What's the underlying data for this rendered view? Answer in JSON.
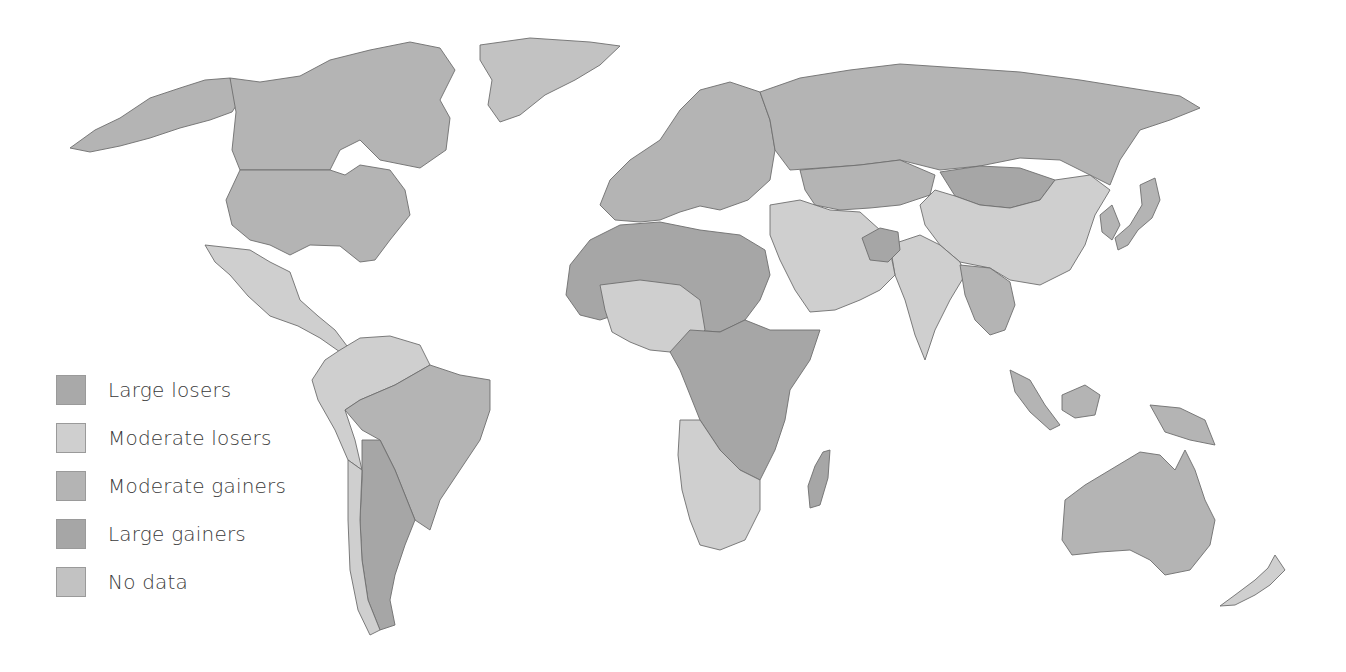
{
  "map": {
    "title": "",
    "colors": {
      "large_losers": "#a9a9a9",
      "moderate_losers": "#cfcfcf",
      "moderate_gainers": "#b4b4b4",
      "large_gainers": "#a6a6a6",
      "no_data": "#c2c2c2",
      "border": "#6e6e6e",
      "background": "#ffffff"
    },
    "regions": [
      {
        "name": "Alaska/USA",
        "class": "moderate_gainers"
      },
      {
        "name": "Canada",
        "class": "moderate_gainers"
      },
      {
        "name": "United States",
        "class": "moderate_gainers"
      },
      {
        "name": "Greenland",
        "class": "no_data"
      },
      {
        "name": "Mexico & Central America",
        "class": "moderate_losers"
      },
      {
        "name": "Colombia/Venezuela/Ecuador/Peru",
        "class": "moderate_losers"
      },
      {
        "name": "Brazil",
        "class": "moderate_gainers"
      },
      {
        "name": "Bolivia/Paraguay/Argentina",
        "class": "large_gainers"
      },
      {
        "name": "Chile",
        "class": "moderate_losers"
      },
      {
        "name": "Europe",
        "class": "moderate_gainers"
      },
      {
        "name": "Russia",
        "class": "moderate_gainers"
      },
      {
        "name": "Kazakhstan/Central Asia",
        "class": "moderate_gainers"
      },
      {
        "name": "Mongolia",
        "class": "large_gainers"
      },
      {
        "name": "China",
        "class": "moderate_losers"
      },
      {
        "name": "India",
        "class": "moderate_losers"
      },
      {
        "name": "Middle East",
        "class": "moderate_losers"
      },
      {
        "name": "Afghanistan",
        "class": "large_gainers"
      },
      {
        "name": "Southeast Asia",
        "class": "moderate_gainers"
      },
      {
        "name": "North Africa",
        "class": "large_gainers"
      },
      {
        "name": "Sahel/West Africa mixed",
        "class": "moderate_losers"
      },
      {
        "name": "Central & East Africa",
        "class": "large_gainers"
      },
      {
        "name": "Southern Africa",
        "class": "moderate_losers"
      },
      {
        "name": "Madagascar",
        "class": "large_gainers"
      },
      {
        "name": "Indonesia/PNG",
        "class": "moderate_gainers"
      },
      {
        "name": "Australia",
        "class": "moderate_gainers"
      },
      {
        "name": "New Zealand",
        "class": "moderate_losers"
      },
      {
        "name": "Japan/Korea",
        "class": "moderate_gainers"
      }
    ]
  },
  "legend": {
    "items": [
      {
        "key": "large_losers",
        "label": "Large losers",
        "color": "#a9a9a9"
      },
      {
        "key": "moderate_losers",
        "label": "Moderate losers",
        "color": "#cfcfcf"
      },
      {
        "key": "moderate_gainers",
        "label": "Moderate gainers",
        "color": "#b4b4b4"
      },
      {
        "key": "large_gainers",
        "label": "Large gainers",
        "color": "#a6a6a6"
      },
      {
        "key": "no_data",
        "label": "No data",
        "color": "#c2c2c2"
      }
    ]
  }
}
